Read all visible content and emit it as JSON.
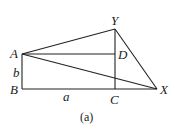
{
  "diagram": {
    "caption": "(a)",
    "points": {
      "A": {
        "label": "A",
        "x": 22,
        "y": 54
      },
      "B": {
        "label": "B",
        "x": 22,
        "y": 89
      },
      "C": {
        "label": "C",
        "x": 115,
        "y": 89
      },
      "D": {
        "label": "D",
        "x": 115,
        "y": 54
      },
      "Y": {
        "label": "Y",
        "x": 115,
        "y": 29
      },
      "X": {
        "label": "X",
        "x": 157,
        "y": 89
      }
    },
    "side_labels": {
      "AB": "b",
      "BC": "a"
    },
    "segments": [
      "AB",
      "BX",
      "AD",
      "YC",
      "AY",
      "AX",
      "YX"
    ]
  }
}
